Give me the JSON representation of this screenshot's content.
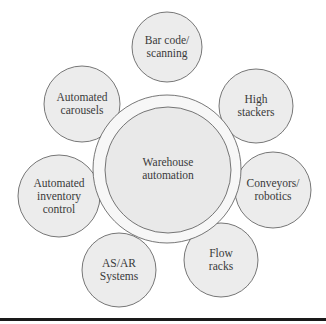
{
  "diagram": {
    "center": {
      "lines": [
        "Warehouse",
        "automation"
      ],
      "cx": 168,
      "cy": 170,
      "r": 63,
      "ring_r": 74,
      "ring_cx": 167,
      "ring_cy": 169
    },
    "nodes": [
      {
        "id": "bar-code-scanning",
        "lines": [
          "Bar code/",
          "scanning"
        ],
        "cx": 167,
        "cy": 47,
        "r": 35
      },
      {
        "id": "high-stackers",
        "lines": [
          "High",
          "stackers"
        ],
        "cx": 256,
        "cy": 106,
        "r": 37
      },
      {
        "id": "conveyors-robotics",
        "lines": [
          "Conveyors/",
          "robotics"
        ],
        "cx": 273,
        "cy": 190,
        "r": 38
      },
      {
        "id": "flow-racks",
        "lines": [
          "Flow",
          "racks"
        ],
        "cx": 221,
        "cy": 260,
        "r": 37
      },
      {
        "id": "as-ar-systems",
        "lines": [
          "AS/AR",
          "Systems"
        ],
        "cx": 119,
        "cy": 270,
        "r": 37
      },
      {
        "id": "automated-inventory-control",
        "lines": [
          "Automated",
          "inventory",
          "control"
        ],
        "cx": 59,
        "cy": 196,
        "r": 41
      },
      {
        "id": "automated-carousels",
        "lines": [
          "Automated",
          "carousels"
        ],
        "cx": 82,
        "cy": 104,
        "r": 38
      }
    ]
  }
}
